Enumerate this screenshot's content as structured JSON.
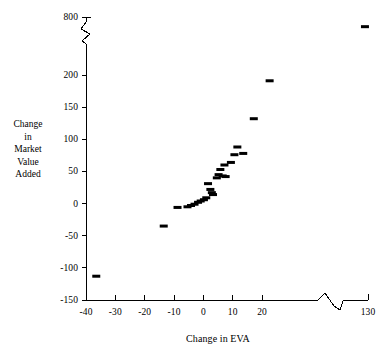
{
  "chart_data": {
    "type": "scatter",
    "title": "",
    "xlabel": "Change in EVA",
    "ylabel": "Change in Market Value Added",
    "ylabel_lines": [
      "Change",
      "in",
      "Market",
      "Value",
      "Added"
    ],
    "xtick_labels": [
      "-40",
      "-30",
      "-20",
      "-10",
      "0",
      "10",
      "20",
      "130"
    ],
    "xtick_values": [
      -40,
      -30,
      -20,
      -10,
      0,
      10,
      20,
      130
    ],
    "ytick_labels": [
      "800",
      "200",
      "150",
      "100",
      "50",
      "0",
      "-50",
      "-100",
      "-150"
    ],
    "ytick_values": [
      800,
      200,
      150,
      100,
      50,
      0,
      -50,
      -100,
      -150
    ],
    "xlim": [
      -44,
      130
    ],
    "ylim": [
      -150,
      800
    ],
    "x_axis_break": true,
    "y_axis_break": true,
    "x_axis_break_between": [
      25,
      125
    ],
    "y_axis_break_between": [
      200,
      800
    ],
    "grid": false,
    "legend": false,
    "marker": "dash",
    "marker_color": "#000000",
    "axis_color": "#000000",
    "points": [
      {
        "x": -36.5,
        "y": -113
      },
      {
        "x": -13.5,
        "y": -35
      },
      {
        "x": -8.8,
        "y": -6
      },
      {
        "x": -5.4,
        "y": -5
      },
      {
        "x": -4.2,
        "y": -3
      },
      {
        "x": -3.0,
        "y": -1
      },
      {
        "x": -1.8,
        "y": 2
      },
      {
        "x": -0.9,
        "y": 4
      },
      {
        "x": 0.2,
        "y": 6
      },
      {
        "x": 1.0,
        "y": 9
      },
      {
        "x": 1.6,
        "y": 31
      },
      {
        "x": 2.4,
        "y": 22
      },
      {
        "x": 2.9,
        "y": 17
      },
      {
        "x": 3.3,
        "y": 14
      },
      {
        "x": 4.6,
        "y": 40
      },
      {
        "x": 5.2,
        "y": 45
      },
      {
        "x": 5.8,
        "y": 53
      },
      {
        "x": 6.6,
        "y": 43
      },
      {
        "x": 7.6,
        "y": 42
      },
      {
        "x": 7.2,
        "y": 60
      },
      {
        "x": 9.4,
        "y": 64
      },
      {
        "x": 10.6,
        "y": 76
      },
      {
        "x": 11.6,
        "y": 88
      },
      {
        "x": 13.6,
        "y": 78
      },
      {
        "x": 17.2,
        "y": 132
      },
      {
        "x": 22.6,
        "y": 191
      },
      {
        "x": 126.5,
        "y": 700
      }
    ]
  }
}
